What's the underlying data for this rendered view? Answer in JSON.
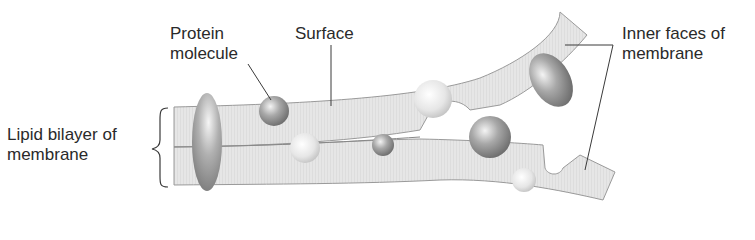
{
  "diagram": {
    "labels": {
      "protein_line1": "Protein",
      "protein_line2": "molecule",
      "surface": "Surface",
      "inner_line1": "Inner faces of",
      "inner_line2": "membrane",
      "bilayer_line1": "Lipid bilayer of",
      "bilayer_line2": "membrane"
    },
    "colors": {
      "membrane_fill": "#e4e4e4",
      "membrane_edge": "#9a9a9a",
      "leader_line": "#3a3a3a",
      "text": "#2a2a2a"
    }
  }
}
